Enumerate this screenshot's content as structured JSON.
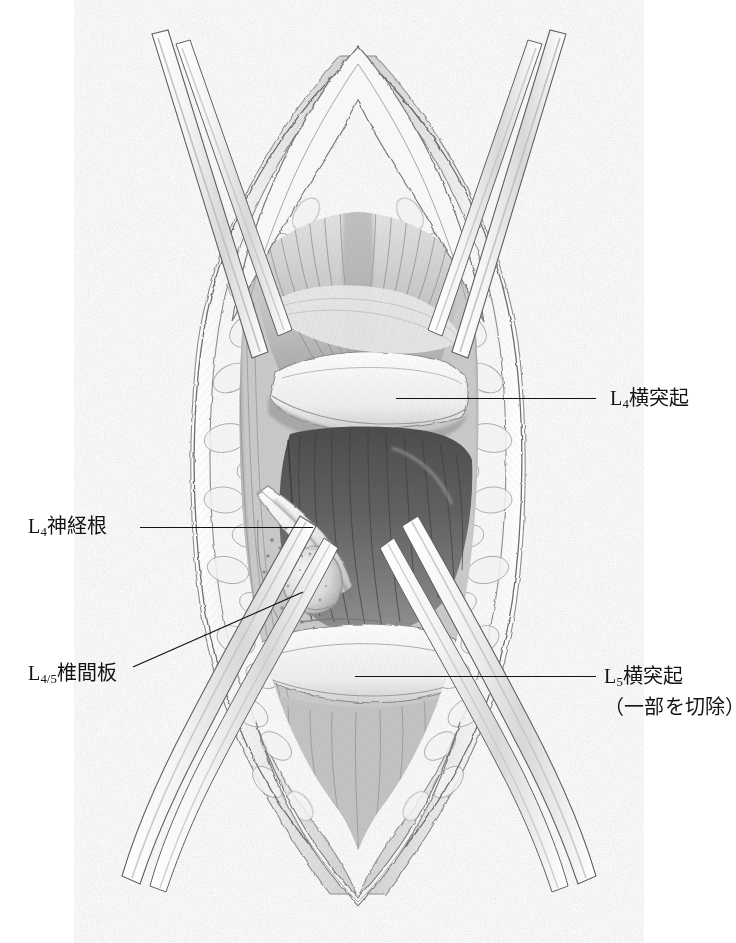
{
  "figure": {
    "kind": "medical-illustration",
    "style": "graphite pencil drawing, grayscale",
    "background_color": "#ffffff",
    "line_color": "#141414"
  },
  "labels": [
    {
      "id": "l4-transverse-process",
      "side": "right",
      "text_main": "L",
      "sub": "4",
      "text_rest": "横突起",
      "full_text": "L4横突起",
      "line2": "",
      "leader": {
        "x1": 396,
        "y1": 398,
        "x2": 596,
        "y2": 398,
        "type": "horizontal"
      }
    },
    {
      "id": "l5-transverse-process",
      "side": "right",
      "text_main": "L",
      "sub": "5",
      "text_rest": "横突起",
      "full_text": "L5横突起",
      "line2": "（一部を切除）",
      "leader": {
        "x1": 355,
        "y1": 676,
        "x2": 596,
        "y2": 676,
        "type": "horizontal"
      }
    },
    {
      "id": "l4-nerve-root",
      "side": "left",
      "text_main": "L",
      "sub": "4",
      "text_rest": "神経根",
      "full_text": "L4神経根",
      "line2": "",
      "leader": {
        "x1": 140,
        "y1": 527,
        "x2": 313,
        "y2": 527,
        "type": "horizontal"
      }
    },
    {
      "id": "l4-5-intervertebral-disc",
      "side": "left",
      "text_main": "L",
      "sub": "4/5",
      "text_rest": "椎間板",
      "full_text": "L4/5椎間板",
      "line2": "",
      "leader": {
        "x1": 133,
        "y1": 667,
        "x2": 303,
        "y2": 592,
        "type": "diagonal"
      }
    }
  ],
  "anatomy": {
    "structures": [
      "skin and subcutaneous fat edges",
      "multifidus muscle",
      "longissimus muscle",
      "L4 transverse process",
      "L5 transverse process (partially resected)",
      "L4 nerve root",
      "L4/5 intervertebral disc",
      "intertransverse membrane"
    ],
    "instruments": [
      "retractor blade",
      "retractor blade",
      "retractor blade",
      "retractor blade"
    ]
  }
}
